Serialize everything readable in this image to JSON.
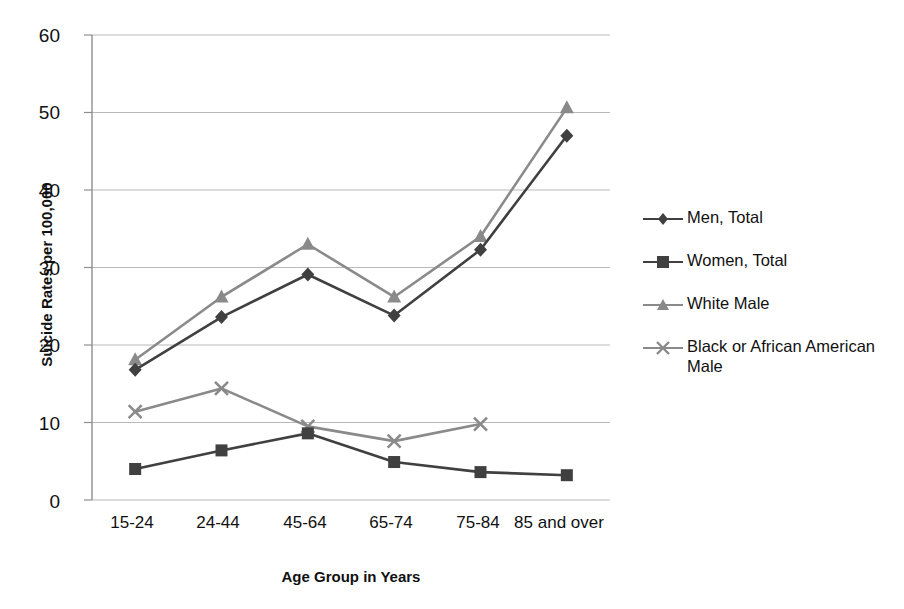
{
  "chart_data": {
    "type": "line",
    "title": "",
    "xlabel": "Age Group in Years",
    "ylabel": "Suicide Rates per 100,000",
    "categories": [
      "15-24",
      "24-44",
      "45-64",
      "65-74",
      "75-84",
      "85 and over"
    ],
    "ylim": [
      0,
      60
    ],
    "yticks": [
      "0",
      "10",
      "20",
      "30",
      "40",
      "50",
      "60"
    ],
    "grid": "horizontal",
    "legend_position": "right",
    "series": [
      {
        "name": "Men, Total",
        "marker": "diamond",
        "color": "#404040",
        "values": [
          16.8,
          23.6,
          29.1,
          23.8,
          32.3,
          47.0
        ]
      },
      {
        "name": "Women, Total",
        "marker": "square",
        "color": "#404040",
        "values": [
          4.0,
          6.4,
          8.6,
          4.9,
          3.6,
          3.2
        ]
      },
      {
        "name": "White Male",
        "marker": "triangle",
        "color": "#8a8a8a",
        "values": [
          18.1,
          26.2,
          33.0,
          26.2,
          34.0,
          50.6
        ]
      },
      {
        "name": "Black or African American Male",
        "marker": "cross",
        "color": "#8a8a8a",
        "values": [
          11.4,
          14.4,
          9.5,
          7.6,
          9.8,
          null
        ]
      }
    ]
  },
  "axis": {
    "y_title": "Suicide Rates per 100,000",
    "x_title": "Age Group in Years",
    "y_ticks": [
      "60",
      "50",
      "40",
      "30",
      "20",
      "10",
      "0"
    ],
    "x_ticks": [
      "15-24",
      "24-44",
      "45-64",
      "65-74",
      "75-84",
      "85 and over"
    ]
  },
  "legend": {
    "items": [
      {
        "label": "Men, Total",
        "color": "#404040",
        "marker": "diamond-marker"
      },
      {
        "label": "Women, Total",
        "color": "#404040",
        "marker": "square-marker"
      },
      {
        "label": "White Male",
        "color": "#8a8a8a",
        "marker": "triangle-marker"
      },
      {
        "label": "Black or African American Male",
        "color": "#8a8a8a",
        "marker": "cross-marker"
      }
    ]
  },
  "colors": {
    "dark_series": "#404040",
    "light_series": "#8a8a8a",
    "gridline": "#b9b9b9",
    "axis": "#8f8f8f",
    "text": "#111111",
    "background": "#ffffff"
  }
}
